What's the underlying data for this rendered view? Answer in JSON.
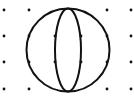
{
  "diagram": {
    "width": 134,
    "height": 111,
    "background": "#ffffff",
    "stroke_color": "#111111",
    "stroke_width": 2,
    "grid_dots": {
      "xs": [
        4,
        29,
        107,
        131
      ],
      "ys": [
        10,
        36,
        62,
        89
      ],
      "radius": 1.4,
      "skip_inside_circle": true
    },
    "outer_circle": {
      "cx": 68,
      "cy": 50,
      "r": 41.5
    },
    "inner_ellipse": {
      "cx": 68,
      "cy": 50,
      "rx": 13,
      "ry": 41.5
    },
    "curve_dots": [
      [
        29,
        36
      ],
      [
        29,
        62
      ],
      [
        55,
        36
      ],
      [
        55,
        62
      ],
      [
        81,
        36
      ],
      [
        81,
        62
      ],
      [
        107,
        36
      ],
      [
        107,
        62
      ]
    ]
  }
}
